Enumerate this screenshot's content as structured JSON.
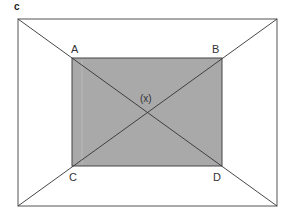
{
  "figure": {
    "panel_label": "c",
    "colors": {
      "line": "#333333",
      "outer_border": "#555555",
      "shaded_fill": "#a9a9a9",
      "background": "#ffffff"
    },
    "outer_rect": {
      "x1": 18,
      "y1": 19,
      "x2": 277,
      "y2": 206
    },
    "inner_rect": {
      "x1": 72,
      "y1": 58,
      "x2": 222,
      "y2": 166
    },
    "points": {
      "A": {
        "label": "A",
        "x": 72,
        "y": 58
      },
      "B": {
        "label": "B",
        "x": 222,
        "y": 58
      },
      "C": {
        "label": "C",
        "x": 72,
        "y": 166
      },
      "D": {
        "label": "D",
        "x": 222,
        "y": 166
      },
      "center": {
        "label": "(x)",
        "x": 147,
        "y": 112
      }
    }
  }
}
